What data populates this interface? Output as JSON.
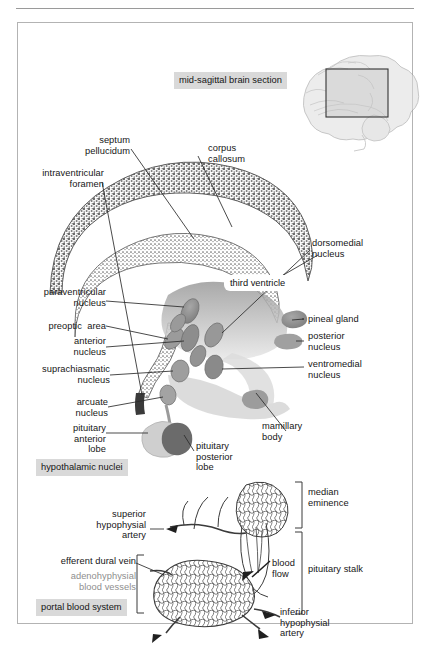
{
  "figure": {
    "inset_caption": "mid-sagittal brain section",
    "panel_captions": {
      "upper": "hypothalamic nuclei",
      "lower": "portal blood system"
    },
    "colors": {
      "frame_border": "#b3b3b3",
      "rule": "#9a9a9a",
      "caption_background": "#d9d9d9",
      "leader_line": "#2b2b2b",
      "stipple_dark": "#6f6f6f",
      "nucleus_gray": "#8d8d8d",
      "pituitary_anterior": "#cfcfcf",
      "pituitary_posterior": "#6b6b6b",
      "text": "#161616",
      "faded_text": "#8e8e8e"
    }
  },
  "upper_panel": {
    "name": "mid-sagittal hypothalamus section",
    "labels_left": [
      {
        "id": "septum-pellucidum",
        "text": "septum\npellucidum"
      },
      {
        "id": "intraventricular-foramen",
        "text": "intraventricular\nforamen"
      },
      {
        "id": "paraventricular-nucleus",
        "text": "paraventricular\nnucleus"
      },
      {
        "id": "preoptic-area",
        "text": "preoptic  area"
      },
      {
        "id": "anterior-nucleus",
        "text": "anterior\nnucleus"
      },
      {
        "id": "suprachiasmatic-nucleus",
        "text": "suprachiasmatic\nnucleus"
      },
      {
        "id": "arcuate-nucleus",
        "text": "arcuate\nnucleus"
      },
      {
        "id": "pituitary-anterior-lobe",
        "text": "pituitary\nanterior\nlobe"
      }
    ],
    "labels_right": [
      {
        "id": "corpus-callosum",
        "text": "corpus\ncallosum"
      },
      {
        "id": "dorsomedial-nucleus",
        "text": "dorsomedial\nnucleus"
      },
      {
        "id": "pineal-gland",
        "text": "pineal gland"
      },
      {
        "id": "posterior-nucleus",
        "text": "posterior\nnucleus"
      },
      {
        "id": "ventromedial-nucleus",
        "text": "ventromedial\nnucleus"
      },
      {
        "id": "mamillary-body",
        "text": "mamillary\nbody"
      },
      {
        "id": "pituitary-posterior-lobe",
        "text": "pituitary\nposterior\nlobe"
      }
    ],
    "labels_inline": [
      {
        "id": "third-ventricle",
        "text": "third ventricle"
      }
    ]
  },
  "lower_panel": {
    "name": "pituitary portal blood system",
    "labels_left": [
      {
        "id": "superior-hypophysial-artery",
        "text": "superior\nhypophysial\nartery"
      },
      {
        "id": "efferent-dural-vein",
        "text": "efferent dural vein"
      },
      {
        "id": "adenohyphysial-blood-vessels",
        "text": "adenohyphysial\nblood vessels"
      }
    ],
    "labels_right": [
      {
        "id": "median-eminence",
        "text": "median\neminence"
      },
      {
        "id": "pituitary-stalk",
        "text": "pituitary stalk"
      },
      {
        "id": "inferior-hypophysial-artery",
        "text": "inferior\nhypophysial\nartery"
      }
    ],
    "labels_inline": [
      {
        "id": "blood-flow",
        "text": "blood\nflow"
      }
    ]
  }
}
